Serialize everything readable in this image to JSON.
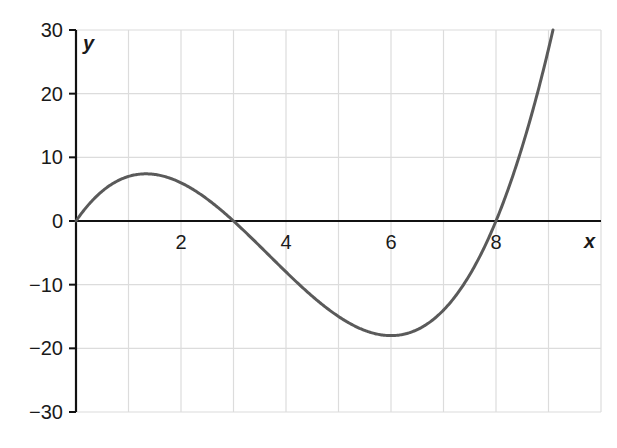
{
  "chart_data": {
    "type": "line",
    "title": "",
    "xlabel": "x",
    "ylabel": "y",
    "xlim": [
      0,
      10
    ],
    "ylim": [
      -30,
      30
    ],
    "grid": true,
    "x_ticks": [
      2,
      4,
      6,
      8
    ],
    "x_tick_labels": [
      "2",
      "4",
      "6",
      "8"
    ],
    "y_ticks": [
      30,
      20,
      10,
      0,
      -10,
      -20,
      -30
    ],
    "y_tick_labels": [
      "30",
      "20",
      "10",
      "0",
      "−10",
      "−20",
      "−30"
    ],
    "series": [
      {
        "name": "y = 0.5x(x−3)(x−8)",
        "color": "#5a5a5a",
        "x": [
          0,
          0.5,
          1,
          1.33,
          1.5,
          2,
          2.5,
          3,
          3.5,
          4,
          4.5,
          5,
          5.5,
          6,
          6.5,
          7,
          7.5,
          8,
          8.5,
          9,
          9.1
        ],
        "y": [
          0,
          4.4,
          7,
          7.4,
          7.3,
          6,
          3.1,
          0,
          -4.4,
          -8,
          -11.3,
          -15,
          -16.5,
          -18,
          -17.9,
          -14,
          -8.4,
          0,
          11.7,
          27,
          28.4
        ]
      }
    ],
    "annotations": [
      {
        "text": "y",
        "position": "top of y-axis"
      },
      {
        "text": "x",
        "position": "right end of x-axis"
      }
    ]
  },
  "colors": {
    "curve": "#5a5a5a",
    "axis": "#111111",
    "grid": "#dcdcdc"
  }
}
